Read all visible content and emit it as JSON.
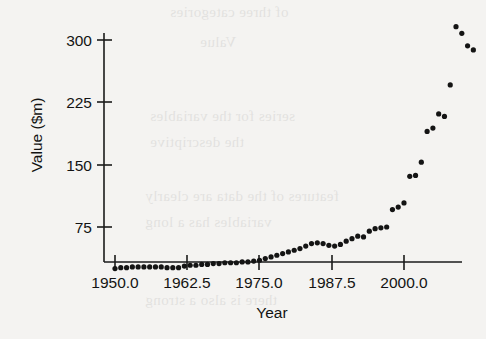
{
  "figure": {
    "background_color": "#f4f3f1",
    "ink_color": "#141414"
  },
  "axis": {
    "x_title": "Year",
    "y_title": "Value ($m)",
    "x_tick_labels": [
      "1950.0",
      "1962.5",
      "1975.0",
      "1987.5",
      "2000.0"
    ],
    "y_tick_labels": [
      "75",
      "150",
      "225",
      "300"
    ]
  },
  "bleed_text": {
    "lines": [
      "of three categories",
      "series for the variables",
      "the descriptive",
      "features of the data are clearly",
      "variables has a long",
      "there is also a strong",
      "Value"
    ]
  },
  "chart_data": {
    "type": "scatter",
    "title": "",
    "xlabel": "Year",
    "ylabel": "Value ($m)",
    "xlim": [
      1948.5,
      2008.5
    ],
    "ylim": [
      0,
      330
    ],
    "xticks": [
      1950.0,
      1962.5,
      1975.0,
      1987.5,
      2000.0
    ],
    "yticks": [
      75,
      150,
      225,
      300
    ],
    "grid": false,
    "legend": false,
    "marker": "filled-circle",
    "marker_color": "#141414",
    "series": [
      {
        "name": "Value ($m)",
        "x": [
          1950,
          1951,
          1952,
          1953,
          1954,
          1955,
          1956,
          1957,
          1958,
          1959,
          1960,
          1961,
          1962,
          1963,
          1964,
          1965,
          1966,
          1967,
          1968,
          1969,
          1970,
          1971,
          1972,
          1973,
          1974,
          1975,
          1976,
          1977,
          1978,
          1979,
          1980,
          1981,
          1982,
          1983,
          1984,
          1985,
          1986,
          1987,
          1988,
          1989,
          1990,
          1991,
          1992,
          1993,
          1994,
          1995,
          1996,
          1997,
          1998,
          1999,
          2000,
          2001,
          2002,
          2003,
          2004,
          2005,
          2006,
          2007
        ],
        "y": [
          25,
          26,
          26,
          27,
          27,
          27,
          27,
          27,
          27,
          26,
          26,
          26,
          28,
          29,
          29,
          30,
          30,
          31,
          31,
          32,
          32,
          32,
          33,
          33,
          34,
          35,
          37,
          39,
          41,
          43,
          45,
          47,
          49,
          52,
          55,
          56,
          55,
          53,
          52,
          54,
          58,
          61,
          64,
          63,
          70,
          73,
          74,
          75,
          96,
          99,
          104,
          136,
          137,
          153,
          190,
          194,
          211,
          208
        ],
        "y_extra_note": "highest cluster",
        "x_tail": [
          2003,
          2004,
          2005,
          2006,
          2007
        ],
        "y_tail": [
          246,
          316,
          308,
          293,
          288
        ]
      }
    ],
    "points": [
      {
        "year": 1950,
        "value": 25
      },
      {
        "year": 1951,
        "value": 26
      },
      {
        "year": 1952,
        "value": 26
      },
      {
        "year": 1953,
        "value": 27
      },
      {
        "year": 1954,
        "value": 27
      },
      {
        "year": 1955,
        "value": 27
      },
      {
        "year": 1956,
        "value": 27
      },
      {
        "year": 1957,
        "value": 27
      },
      {
        "year": 1958,
        "value": 27
      },
      {
        "year": 1959,
        "value": 26
      },
      {
        "year": 1960,
        "value": 26
      },
      {
        "year": 1961,
        "value": 26
      },
      {
        "year": 1962,
        "value": 28
      },
      {
        "year": 1963,
        "value": 29
      },
      {
        "year": 1964,
        "value": 29
      },
      {
        "year": 1965,
        "value": 30
      },
      {
        "year": 1966,
        "value": 30
      },
      {
        "year": 1967,
        "value": 31
      },
      {
        "year": 1968,
        "value": 31
      },
      {
        "year": 1969,
        "value": 32
      },
      {
        "year": 1970,
        "value": 32
      },
      {
        "year": 1971,
        "value": 32
      },
      {
        "year": 1972,
        "value": 33
      },
      {
        "year": 1973,
        "value": 33
      },
      {
        "year": 1974,
        "value": 34
      },
      {
        "year": 1975,
        "value": 35
      },
      {
        "year": 1976,
        "value": 37
      },
      {
        "year": 1977,
        "value": 39
      },
      {
        "year": 1978,
        "value": 41
      },
      {
        "year": 1979,
        "value": 43
      },
      {
        "year": 1980,
        "value": 45
      },
      {
        "year": 1981,
        "value": 47
      },
      {
        "year": 1982,
        "value": 49
      },
      {
        "year": 1983,
        "value": 52
      },
      {
        "year": 1984,
        "value": 55
      },
      {
        "year": 1985,
        "value": 56
      },
      {
        "year": 1986,
        "value": 55
      },
      {
        "year": 1987,
        "value": 53
      },
      {
        "year": 1988,
        "value": 52
      },
      {
        "year": 1989,
        "value": 54
      },
      {
        "year": 1990,
        "value": 58
      },
      {
        "year": 1991,
        "value": 61
      },
      {
        "year": 1992,
        "value": 64
      },
      {
        "year": 1993,
        "value": 63
      },
      {
        "year": 1994,
        "value": 70
      },
      {
        "year": 1995,
        "value": 73
      },
      {
        "year": 1996,
        "value": 74
      },
      {
        "year": 1997,
        "value": 75
      },
      {
        "year": 1998,
        "value": 96
      },
      {
        "year": 1999,
        "value": 99
      },
      {
        "year": 2000,
        "value": 104
      },
      {
        "year": 2001,
        "value": 136
      },
      {
        "year": 2002,
        "value": 137
      },
      {
        "year": 2003,
        "value": 153
      },
      {
        "year": 2004,
        "value": 190
      },
      {
        "year": 2005,
        "value": 194
      },
      {
        "year": 2006,
        "value": 211
      },
      {
        "year": 2007,
        "value": 208
      },
      {
        "year": 2008,
        "value": 246
      },
      {
        "year": 2009,
        "value": 316
      },
      {
        "year": 2010,
        "value": 308
      },
      {
        "year": 2011,
        "value": 293
      },
      {
        "year": 2012,
        "value": 288
      }
    ]
  }
}
